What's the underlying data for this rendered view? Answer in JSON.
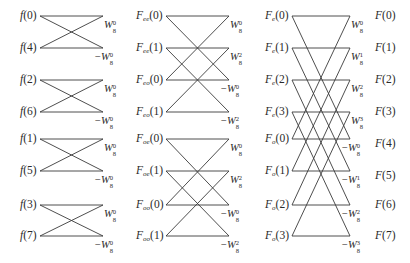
{
  "diagram": {
    "type": "FFT butterfly (8-point, decimation in time)",
    "stage1": {
      "inputs": [
        {
          "name": "f",
          "sub": "",
          "idx": "0",
          "y": 16
        },
        {
          "name": "f",
          "sub": "",
          "idx": "4",
          "y": 48
        },
        {
          "name": "f",
          "sub": "",
          "idx": "2",
          "y": 80
        },
        {
          "name": "f",
          "sub": "",
          "idx": "6",
          "y": 112
        },
        {
          "name": "f",
          "sub": "",
          "idx": "1",
          "y": 139
        },
        {
          "name": "f",
          "sub": "",
          "idx": "5",
          "y": 171
        },
        {
          "name": "f",
          "sub": "",
          "idx": "3",
          "y": 205
        },
        {
          "name": "f",
          "sub": "",
          "idx": "7",
          "y": 236
        }
      ],
      "twiddles": [
        {
          "sign": "",
          "base": "W",
          "exp": "0",
          "n": "8"
        },
        {
          "sign": "−",
          "base": "W",
          "exp": "0",
          "n": "8"
        },
        {
          "sign": "",
          "base": "W",
          "exp": "0",
          "n": "8"
        },
        {
          "sign": "−",
          "base": "W",
          "exp": "0",
          "n": "8"
        },
        {
          "sign": "",
          "base": "W",
          "exp": "0",
          "n": "8"
        },
        {
          "sign": "−",
          "base": "W",
          "exp": "0",
          "n": "8"
        },
        {
          "sign": "",
          "base": "W",
          "exp": "0",
          "n": "8"
        },
        {
          "sign": "−",
          "base": "W",
          "exp": "0",
          "n": "8"
        }
      ]
    },
    "stage2": {
      "inputs": [
        {
          "name": "F",
          "sub": "ee",
          "idx": "0"
        },
        {
          "name": "F",
          "sub": "ee",
          "idx": "1"
        },
        {
          "name": "F",
          "sub": "eo",
          "idx": "0"
        },
        {
          "name": "F",
          "sub": "eo",
          "idx": "1"
        },
        {
          "name": "F",
          "sub": "oe",
          "idx": "0"
        },
        {
          "name": "F",
          "sub": "oe",
          "idx": "1"
        },
        {
          "name": "F",
          "sub": "oo",
          "idx": "0"
        },
        {
          "name": "F",
          "sub": "oo",
          "idx": "1"
        }
      ],
      "twiddles": [
        {
          "sign": "",
          "base": "W",
          "exp": "0",
          "n": "8"
        },
        {
          "sign": "",
          "base": "W",
          "exp": "2",
          "n": "8"
        },
        {
          "sign": "−",
          "base": "W",
          "exp": "0",
          "n": "8"
        },
        {
          "sign": "−",
          "base": "W",
          "exp": "2",
          "n": "8"
        },
        {
          "sign": "",
          "base": "W",
          "exp": "0",
          "n": "8"
        },
        {
          "sign": "",
          "base": "W",
          "exp": "2",
          "n": "8"
        },
        {
          "sign": "−",
          "base": "W",
          "exp": "0",
          "n": "8"
        },
        {
          "sign": "−",
          "base": "W",
          "exp": "2",
          "n": "8"
        }
      ]
    },
    "stage3": {
      "inputs": [
        {
          "name": "F",
          "sub": "e",
          "idx": "0"
        },
        {
          "name": "F",
          "sub": "e",
          "idx": "1"
        },
        {
          "name": "F",
          "sub": "e",
          "idx": "2"
        },
        {
          "name": "F",
          "sub": "e",
          "idx": "3"
        },
        {
          "name": "F",
          "sub": "o",
          "idx": "0"
        },
        {
          "name": "F",
          "sub": "o",
          "idx": "1"
        },
        {
          "name": "F",
          "sub": "o",
          "idx": "2"
        },
        {
          "name": "F",
          "sub": "o",
          "idx": "3"
        }
      ],
      "twiddles": [
        {
          "sign": "",
          "base": "W",
          "exp": "0",
          "n": "8"
        },
        {
          "sign": "",
          "base": "W",
          "exp": "1",
          "n": "8"
        },
        {
          "sign": "",
          "base": "W",
          "exp": "2",
          "n": "8"
        },
        {
          "sign": "",
          "base": "W",
          "exp": "3",
          "n": "8"
        },
        {
          "sign": "−",
          "base": "W",
          "exp": "0",
          "n": "8"
        },
        {
          "sign": "−",
          "base": "W",
          "exp": "1",
          "n": "8"
        },
        {
          "sign": "−",
          "base": "W",
          "exp": "2",
          "n": "8"
        },
        {
          "sign": "−",
          "base": "W",
          "exp": "3",
          "n": "8"
        }
      ]
    },
    "outputs": [
      {
        "name": "F",
        "idx": "0"
      },
      {
        "name": "F",
        "idx": "1"
      },
      {
        "name": "F",
        "idx": "2"
      },
      {
        "name": "F",
        "idx": "3"
      },
      {
        "name": "F",
        "idx": "4"
      },
      {
        "name": "F",
        "idx": "5"
      },
      {
        "name": "F",
        "idx": "6"
      },
      {
        "name": "F",
        "idx": "7"
      }
    ],
    "row_y": [
      16,
      48,
      80,
      112,
      139,
      171,
      205,
      236
    ],
    "line_color": "#3a3a3a"
  }
}
